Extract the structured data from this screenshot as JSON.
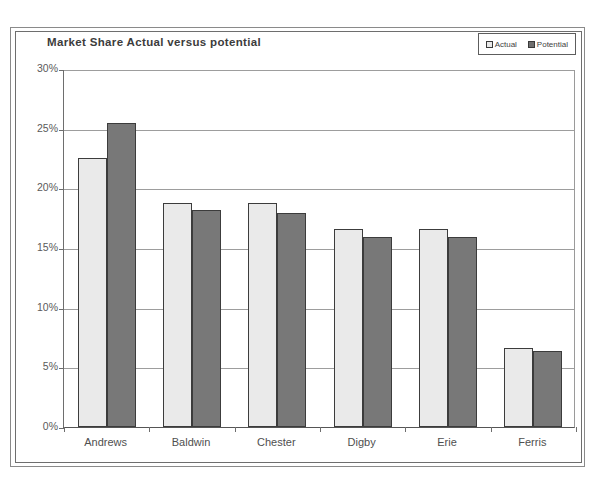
{
  "chart_data": {
    "type": "bar",
    "title": "Market Share Actual versus potential",
    "xlabel": "",
    "ylabel": "",
    "categories": [
      "Andrews",
      "Baldwin",
      "Chester",
      "Digby",
      "Erie",
      "Ferris"
    ],
    "series": [
      {
        "name": "Actual",
        "values": [
          22.5,
          18.8,
          18.8,
          16.6,
          16.6,
          6.6
        ]
      },
      {
        "name": "Potential",
        "values": [
          25.5,
          18.2,
          17.9,
          15.9,
          15.9,
          6.4
        ]
      }
    ],
    "ylim": [
      0,
      30
    ],
    "yticks": [
      0,
      5,
      10,
      15,
      20,
      25,
      30
    ],
    "ytick_labels": [
      "0%",
      "5%",
      "10%",
      "15%",
      "20%",
      "25%",
      "30%"
    ],
    "grid": true,
    "legend_position": "top-right",
    "value_suffix": "%",
    "colors": {
      "actual": "#eaeaea",
      "potential": "#787878",
      "bar_outline": "#3c3c3c",
      "gridline": "#9d9d9d",
      "axis": "#6e6e6e",
      "text": "#4f4f4f",
      "title": "#3c3c3c",
      "frame": "#8a8a8a",
      "background": "#ffffff"
    }
  },
  "legend": {
    "entries": [
      {
        "label": "Actual"
      },
      {
        "label": "Potential"
      }
    ]
  },
  "scan": {
    "artifact_text": ""
  }
}
